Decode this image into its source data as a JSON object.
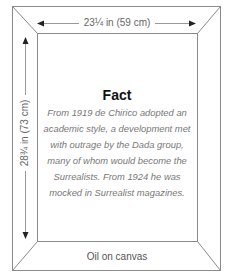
{
  "artwork": {
    "width_label": "23¼ in (59 cm)",
    "height_label": "28¾ in (73 cm)",
    "medium": "Oil on canvas"
  },
  "fact": {
    "title": "Fact",
    "text": "From 1919 de Chirico adopted an academic style, a development met with outrage by the Dada group, many of whom would become the Surrealists. From 1924 he was mocked in Surrealist magazines."
  },
  "colors": {
    "frame_line": "#8a8a8a",
    "arrow": "#222222",
    "arrow_line": "#999999"
  }
}
